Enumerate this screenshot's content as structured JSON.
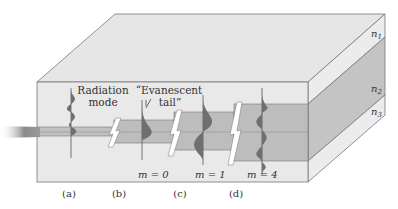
{
  "figure": {
    "type": "planar waveguide modes diagram",
    "layers": [
      {
        "id": "n1",
        "label": "n",
        "sub": "1",
        "role": "cover"
      },
      {
        "id": "n2",
        "label": "n",
        "sub": "2",
        "role": "core"
      },
      {
        "id": "n3",
        "label": "n",
        "sub": "3",
        "role": "substrate"
      }
    ],
    "annotations": {
      "radiation": [
        "Radiation",
        "mode"
      ],
      "evanescent": [
        "“Evanescent",
        "tail”"
      ]
    },
    "modes": [
      {
        "panel": "(a)",
        "mode_label": ""
      },
      {
        "panel": "(b)",
        "mode_label": "m = 0"
      },
      {
        "panel": "(c)",
        "mode_label": "m = 1"
      },
      {
        "panel": "(d)",
        "mode_label": "m = 4"
      }
    ],
    "colors": {
      "top": "#e6e6e6",
      "front": "#e9e9e9",
      "side": "#ececec",
      "core": "#bdbdbd",
      "core_side": "#c4c4c4",
      "wave": "#6f6f6f",
      "edge": "#666666"
    }
  }
}
